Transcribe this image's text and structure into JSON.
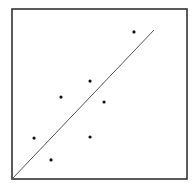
{
  "chart_data": {
    "type": "scatter",
    "title": "",
    "xlabel": "",
    "ylabel": "",
    "xlim": [
      0,
      10
    ],
    "ylim": [
      0,
      10
    ],
    "grid": false,
    "legend": null,
    "ticks": false,
    "series": [
      {
        "name": "points",
        "marker": "dot",
        "color": "#111111",
        "x": [
          1.26,
          2.23,
          2.8,
          4.46,
          4.46,
          5.26,
          6.97
        ],
        "y": [
          2.41,
          1.12,
          4.82,
          5.76,
          2.47,
          4.53,
          8.65
        ]
      }
    ],
    "lines": [
      {
        "name": "fit-line",
        "color": "#555555",
        "x": [
          0,
          8.11
        ],
        "y": [
          0,
          8.76
        ]
      }
    ]
  },
  "style": {
    "frame_color": "#333333",
    "point_color": "#111111",
    "line_color": "#555555",
    "background": "#ffffff"
  },
  "layout": {
    "plot_left": 12,
    "plot_top": 9,
    "plot_width": 175,
    "plot_height": 170
  }
}
